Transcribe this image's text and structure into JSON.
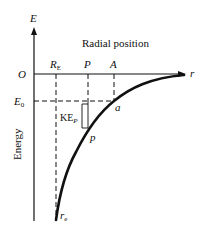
{
  "diagram": {
    "title": "Radial position",
    "y_axis_label": "Energy",
    "y_axis_symbol": "E",
    "x_axis_symbol": "r",
    "origin_label": "O",
    "energy_level_label": "E",
    "energy_level_subscript": "0",
    "kinetic_energy_label": "KE",
    "kinetic_energy_subscript": "P",
    "positions": [
      {
        "label": "R",
        "subscript": "E"
      },
      {
        "label": "P",
        "subscript": ""
      },
      {
        "label": "A",
        "subscript": ""
      }
    ],
    "curve_points": [
      {
        "label": "a"
      },
      {
        "label": "p"
      },
      {
        "label": "r",
        "subscript": "e"
      }
    ],
    "colors": {
      "ink": "#111111",
      "background": "#ffffff"
    }
  }
}
